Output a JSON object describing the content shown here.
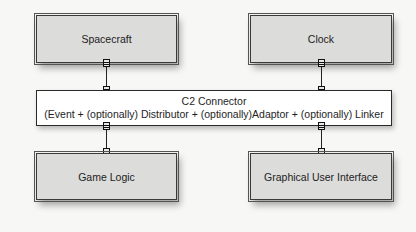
{
  "diagram": {
    "components": {
      "spacecraft": "Spacecraft",
      "clock": "Clock",
      "game_logic": "Game Logic",
      "gui": "Graphical User Interface"
    },
    "connector": {
      "title": "C2 Connector",
      "subtitle": "(Event + (optionally) Distributor + (optionally)Adaptor + (optionally) Linker"
    },
    "links": [
      {
        "from": "Spacecraft",
        "to": "C2 Connector"
      },
      {
        "from": "Clock",
        "to": "C2 Connector"
      },
      {
        "from": "C2 Connector",
        "to": "Game Logic"
      },
      {
        "from": "C2 Connector",
        "to": "Graphical User Interface"
      }
    ]
  }
}
